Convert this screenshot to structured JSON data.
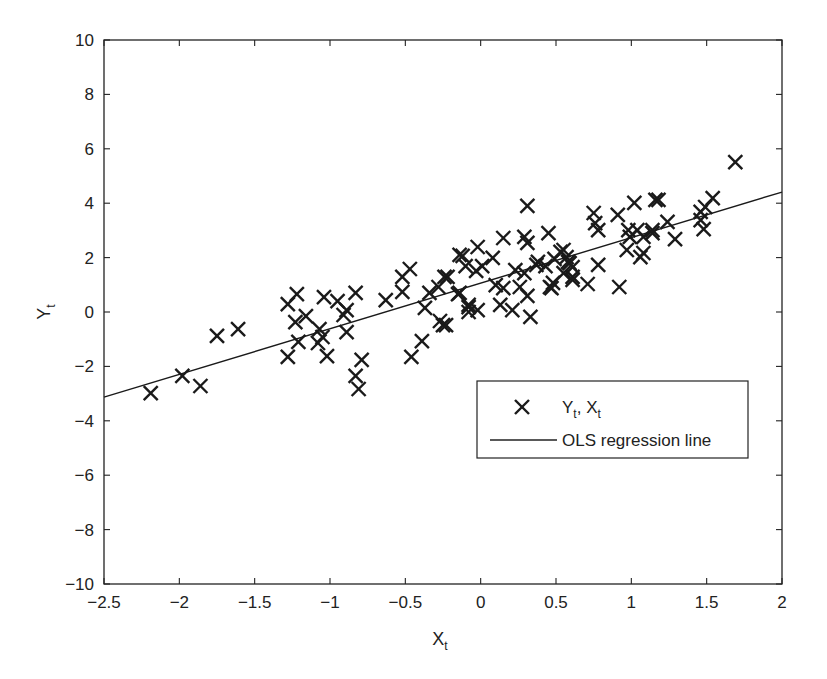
{
  "chart_data": {
    "type": "scatter",
    "title": "",
    "xlabel": "X",
    "xlabel_sub": "t",
    "ylabel": "Y",
    "ylabel_sub": "t",
    "xlim": [
      -2.5,
      2
    ],
    "ylim": [
      -10,
      10
    ],
    "xticks": [
      -2.5,
      -2,
      -1.5,
      -1,
      -0.5,
      0,
      0.5,
      1,
      1.5,
      2
    ],
    "xtick_labels": [
      "−2.5",
      "−2",
      "−1.5",
      "−1",
      "−0.5",
      "0",
      "0.5",
      "1",
      "1.5",
      "2"
    ],
    "yticks": [
      -10,
      -8,
      -6,
      -4,
      -2,
      0,
      2,
      4,
      6,
      8,
      10
    ],
    "ytick_labels": [
      "−10",
      "−8",
      "−6",
      "−4",
      "−2",
      "0",
      "2",
      "4",
      "6",
      "8",
      "10"
    ],
    "grid": false,
    "legend_position": "lower right (inside axes)",
    "legend": [
      {
        "label": "Y",
        "label_sub1": "t",
        "label_mid": ", X",
        "label_sub2": "t",
        "marker": "x"
      },
      {
        "label": "OLS regression line",
        "marker": "line"
      }
    ],
    "series": [
      {
        "name": "Yt, Xt",
        "marker": "x",
        "color": "#1a1a1a",
        "points": [
          [
            -2.19,
            -2.98
          ],
          [
            -1.98,
            -2.35
          ],
          [
            -1.86,
            -2.72
          ],
          [
            -1.75,
            -0.88
          ],
          [
            -1.61,
            -0.63
          ],
          [
            -1.28,
            0.29
          ],
          [
            -1.22,
            0.66
          ],
          [
            -1.23,
            -0.37
          ],
          [
            -1.16,
            -0.15
          ],
          [
            -1.21,
            -1.1
          ],
          [
            -1.28,
            -1.65
          ],
          [
            -1.04,
            0.55
          ],
          [
            -0.95,
            0.4
          ],
          [
            -0.83,
            0.7
          ],
          [
            -0.89,
            0.07
          ],
          [
            -0.91,
            -0.11
          ],
          [
            -1.07,
            -0.63
          ],
          [
            -1.05,
            -0.92
          ],
          [
            -1.08,
            -1.14
          ],
          [
            -1.02,
            -1.62
          ],
          [
            -0.89,
            -0.74
          ],
          [
            -0.79,
            -1.76
          ],
          [
            -0.83,
            -2.35
          ],
          [
            -0.81,
            -2.83
          ],
          [
            -0.63,
            0.44
          ],
          [
            -0.47,
            1.58
          ],
          [
            -0.52,
            1.29
          ],
          [
            -0.52,
            0.74
          ],
          [
            -0.34,
            0.7
          ],
          [
            -0.28,
            0.92
          ],
          [
            -0.22,
            1.29
          ],
          [
            -0.37,
            0.15
          ],
          [
            -0.25,
            -0.48
          ],
          [
            -0.27,
            -0.33
          ],
          [
            -0.39,
            -1.07
          ],
          [
            -0.46,
            -1.65
          ],
          [
            -0.14,
            2.1
          ],
          [
            -0.02,
            2.39
          ],
          [
            -0.14,
            0.7
          ],
          [
            -0.08,
            0.18
          ],
          [
            -0.08,
            0.0
          ],
          [
            0.31,
            3.9
          ],
          [
            0.15,
            2.72
          ],
          [
            0.29,
            2.76
          ],
          [
            0.31,
            2.54
          ],
          [
            0.45,
            2.9
          ],
          [
            -0.12,
            2.06
          ],
          [
            0.08,
            1.99
          ],
          [
            0.01,
            1.69
          ],
          [
            -0.03,
            1.51
          ],
          [
            -0.24,
            1.29
          ],
          [
            -0.1,
            1.69
          ],
          [
            0.23,
            1.54
          ],
          [
            0.29,
            1.43
          ],
          [
            0.38,
            1.84
          ],
          [
            0.49,
            1.95
          ],
          [
            0.1,
            0.99
          ],
          [
            0.15,
            0.88
          ],
          [
            0.26,
            0.92
          ],
          [
            0.46,
            0.92
          ],
          [
            -0.15,
            0.66
          ],
          [
            0.31,
            0.59
          ],
          [
            -0.08,
            0.26
          ],
          [
            -0.02,
            0.07
          ],
          [
            0.13,
            0.26
          ],
          [
            0.21,
            0.07
          ],
          [
            0.33,
            -0.18
          ],
          [
            -0.23,
            -0.48
          ],
          [
            1.02,
            4.01
          ],
          [
            1.16,
            4.12
          ],
          [
            0.75,
            3.64
          ],
          [
            0.91,
            3.57
          ],
          [
            0.76,
            3.27
          ],
          [
            0.78,
            3.01
          ],
          [
            0.98,
            3.01
          ],
          [
            1.04,
            3.01
          ],
          [
            1.14,
            3.01
          ],
          [
            0.99,
            2.76
          ],
          [
            0.97,
            2.28
          ],
          [
            1.06,
            2.02
          ],
          [
            0.53,
            2.21
          ],
          [
            0.57,
            2.02
          ],
          [
            0.59,
            1.8
          ],
          [
            0.61,
            1.65
          ],
          [
            0.43,
            1.69
          ],
          [
            0.78,
            1.73
          ],
          [
            0.61,
            1.29
          ],
          [
            0.48,
            1.07
          ],
          [
            0.47,
            0.88
          ],
          [
            0.71,
            1.03
          ],
          [
            0.92,
            0.92
          ],
          [
            0.55,
            2.28
          ],
          [
            0.58,
            1.84
          ],
          [
            0.55,
            1.43
          ],
          [
            0.37,
            1.73
          ],
          [
            0.61,
            1.18
          ],
          [
            1.69,
            5.51
          ],
          [
            1.18,
            4.12
          ],
          [
            1.54,
            4.19
          ],
          [
            1.49,
            3.86
          ],
          [
            1.46,
            3.68
          ],
          [
            1.46,
            3.38
          ],
          [
            1.48,
            3.05
          ],
          [
            1.24,
            3.31
          ],
          [
            1.14,
            2.9
          ],
          [
            1.29,
            2.68
          ],
          [
            1.08,
            2.76
          ],
          [
            1.08,
            2.17
          ]
        ]
      },
      {
        "name": "OLS regression line",
        "type": "line",
        "color": "#1a1a1a",
        "x": [
          -2.5,
          2
        ],
        "y": [
          -3.13,
          4.41
        ]
      }
    ]
  }
}
